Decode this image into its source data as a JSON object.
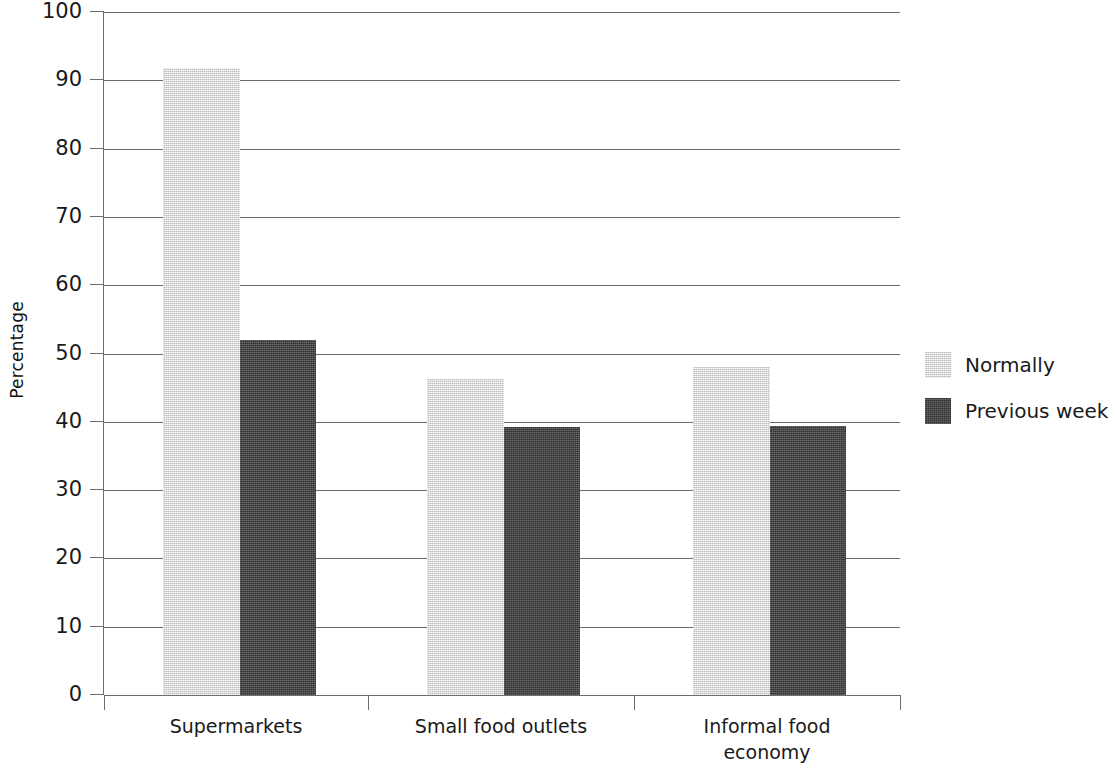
{
  "chart_data": {
    "type": "bar",
    "title": "",
    "subtitle": "",
    "xlabel": "",
    "ylabel": "Percentage",
    "categories": [
      "Supermarkets",
      "Small food outlets",
      "Informal food economy"
    ],
    "category_lines": [
      [
        "Supermarkets"
      ],
      [
        "Small food outlets"
      ],
      [
        "Informal food",
        "economy"
      ]
    ],
    "series": [
      {
        "name": "Normally",
        "color": "#d8d8d8",
        "values": [
          91.8,
          46.2,
          48.0
        ]
      },
      {
        "name": "Previous week",
        "color": "#464646",
        "values": [
          52.0,
          39.2,
          39.4
        ]
      }
    ],
    "ylim": [
      0,
      100
    ],
    "ytick_values": [
      0,
      10,
      20,
      30,
      40,
      50,
      60,
      70,
      80,
      90,
      100
    ],
    "ytick_labels": [
      "0",
      "10",
      "20",
      "30",
      "40",
      "50",
      "60",
      "70",
      "80",
      "90",
      "100"
    ],
    "grid": true,
    "grid_axis": "y",
    "legend_position": "right",
    "legend": [
      "Normally",
      "Previous week"
    ]
  },
  "axis": {
    "y_title": "Percentage"
  },
  "legend": {
    "items": [
      {
        "label": "Normally"
      },
      {
        "label": "Previous week"
      }
    ]
  }
}
